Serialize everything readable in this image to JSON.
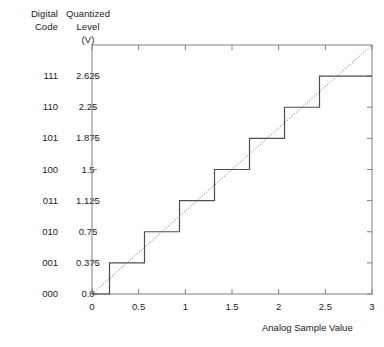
{
  "headers": {
    "col1_line1": "Digital",
    "col1_line2": "Code",
    "col2_line1": "Quantized",
    "col2_line2": "Level",
    "col2_line3": "(V)"
  },
  "rows": [
    {
      "code": "111",
      "level": "2.625"
    },
    {
      "code": "110",
      "level": "2.25"
    },
    {
      "code": "101",
      "level": "1.875"
    },
    {
      "code": "100",
      "level": "1.5"
    },
    {
      "code": "011",
      "level": "1.125"
    },
    {
      "code": "010",
      "level": "0.75"
    },
    {
      "code": "001",
      "level": "0.375"
    },
    {
      "code": "000",
      "level": "0.0"
    }
  ],
  "colors": {
    "line": "#4d4d4d",
    "axis": "#808080",
    "text": "#1a1a1a",
    "background": "#ffffff"
  },
  "chart_data": {
    "type": "line",
    "title": "",
    "xlabel": "Analog Sample Value",
    "ylabel": "Quantized Level (V)",
    "xlim": [
      0,
      3
    ],
    "ylim": [
      0,
      3
    ],
    "grid": false,
    "legend": null,
    "xticks": [
      0,
      0.5,
      1,
      1.5,
      2,
      2.5,
      3
    ],
    "xticklabels": [
      "0",
      "0.5",
      "1",
      "1.5",
      "2",
      "2.5",
      "3"
    ],
    "yticks": [
      0.0,
      0.375,
      0.75,
      1.125,
      1.5,
      1.875,
      2.25,
      2.625
    ],
    "yticklabels": [
      "0.0",
      "0.375",
      "0.75",
      "1.125",
      "1.5",
      "1.875",
      "2.25",
      "2.625"
    ],
    "digital_codes": [
      "000",
      "001",
      "010",
      "011",
      "100",
      "101",
      "110",
      "111"
    ],
    "series": [
      {
        "name": "Quantizer staircase",
        "style": "step",
        "x": [
          0,
          0.1875,
          0.1875,
          0.5625,
          0.5625,
          0.9375,
          0.9375,
          1.3125,
          1.3125,
          1.6875,
          1.6875,
          2.0625,
          2.0625,
          2.4375,
          2.4375,
          3
        ],
        "y": [
          0,
          0,
          0.375,
          0.375,
          0.75,
          0.75,
          1.125,
          1.125,
          1.5,
          1.5,
          1.875,
          1.875,
          2.25,
          2.25,
          2.625,
          2.625
        ]
      },
      {
        "name": "Ideal linear reference",
        "style": "dotted",
        "x": [
          0,
          3
        ],
        "y": [
          0,
          3
        ]
      }
    ]
  }
}
